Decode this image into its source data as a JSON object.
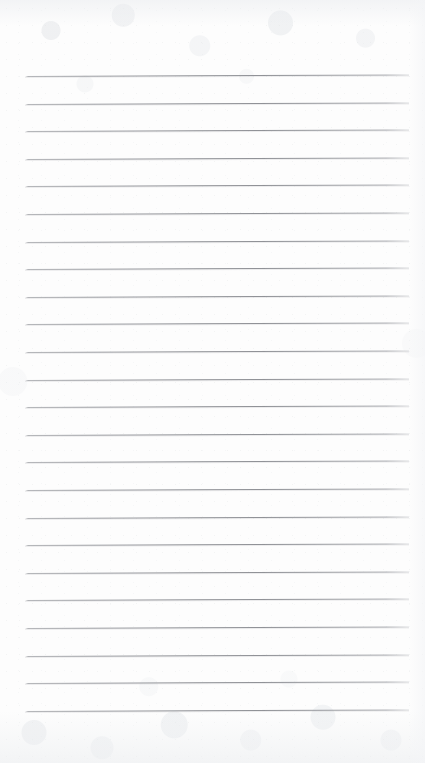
{
  "document": {
    "type": "scanned-lined-notepad-page",
    "title": "Blank ruled notepad sheet",
    "content_text": "",
    "is_blank": true,
    "page_width": 425,
    "page_height": 763,
    "paper_color": "#fdfdfd",
    "rule_color": "#8b8d92",
    "rule_count": 24,
    "rule_left_x": 25,
    "rule_right_x": 409,
    "first_rule_y": 76,
    "rule_spacing": 27.6,
    "rule_thickness": 1,
    "rule_tilt_deg": -0.22,
    "top_margin_label": "",
    "bottom_margin_label": "",
    "rules": [
      {
        "index": 1,
        "y": 76.0
      },
      {
        "index": 2,
        "y": 103.6
      },
      {
        "index": 3,
        "y": 131.2
      },
      {
        "index": 4,
        "y": 158.8
      },
      {
        "index": 5,
        "y": 186.4
      },
      {
        "index": 6,
        "y": 214.0
      },
      {
        "index": 7,
        "y": 241.6
      },
      {
        "index": 8,
        "y": 269.2
      },
      {
        "index": 9,
        "y": 296.8
      },
      {
        "index": 10,
        "y": 324.4
      },
      {
        "index": 11,
        "y": 352.0
      },
      {
        "index": 12,
        "y": 379.6
      },
      {
        "index": 13,
        "y": 407.2
      },
      {
        "index": 14,
        "y": 434.8
      },
      {
        "index": 15,
        "y": 462.4
      },
      {
        "index": 16,
        "y": 490.0
      },
      {
        "index": 17,
        "y": 517.6
      },
      {
        "index": 18,
        "y": 545.2
      },
      {
        "index": 19,
        "y": 572.8
      },
      {
        "index": 20,
        "y": 600.4
      },
      {
        "index": 21,
        "y": 628.0
      },
      {
        "index": 22,
        "y": 655.6
      },
      {
        "index": 23,
        "y": 683.2
      },
      {
        "index": 24,
        "y": 710.8
      }
    ]
  }
}
